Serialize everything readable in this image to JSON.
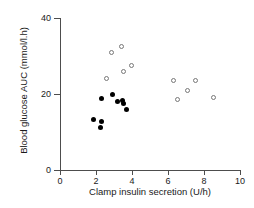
{
  "chart_data": {
    "type": "scatter",
    "title": "",
    "xlabel": "Clamp insulin secretion (U/h)",
    "ylabel": "Blood glucose AUC (mmol/l.h)",
    "xlim": [
      0,
      10
    ],
    "ylim": [
      0,
      40
    ],
    "xticks": [
      0,
      2,
      4,
      6,
      8,
      10
    ],
    "yticks": [
      0,
      20,
      40
    ],
    "xtick_labels": [
      "0",
      "2",
      "4",
      "6",
      "8",
      "10"
    ],
    "ytick_labels": [
      "0",
      "20",
      "40"
    ],
    "grid": false,
    "legend": false,
    "series": [
      {
        "name": "filled-circles",
        "marker": "filled-circle",
        "color": "#000000",
        "points": [
          {
            "x": 1.85,
            "y": 13.3
          },
          {
            "x": 2.25,
            "y": 11.3
          },
          {
            "x": 2.3,
            "y": 12.8
          },
          {
            "x": 2.3,
            "y": 18.8
          },
          {
            "x": 2.9,
            "y": 19.8
          },
          {
            "x": 3.2,
            "y": 18.0
          },
          {
            "x": 3.45,
            "y": 18.3
          },
          {
            "x": 3.5,
            "y": 17.5
          },
          {
            "x": 3.7,
            "y": 16.0
          }
        ]
      },
      {
        "name": "open-circles",
        "marker": "open-circle",
        "color": "#777777",
        "points": [
          {
            "x": 2.6,
            "y": 24.0
          },
          {
            "x": 2.85,
            "y": 31.0
          },
          {
            "x": 3.4,
            "y": 32.5
          },
          {
            "x": 3.5,
            "y": 26.0
          },
          {
            "x": 3.95,
            "y": 27.5
          },
          {
            "x": 6.3,
            "y": 23.5
          },
          {
            "x": 6.55,
            "y": 18.5
          },
          {
            "x": 7.1,
            "y": 21.0
          },
          {
            "x": 7.5,
            "y": 23.5
          },
          {
            "x": 8.5,
            "y": 19.0
          }
        ]
      }
    ]
  }
}
